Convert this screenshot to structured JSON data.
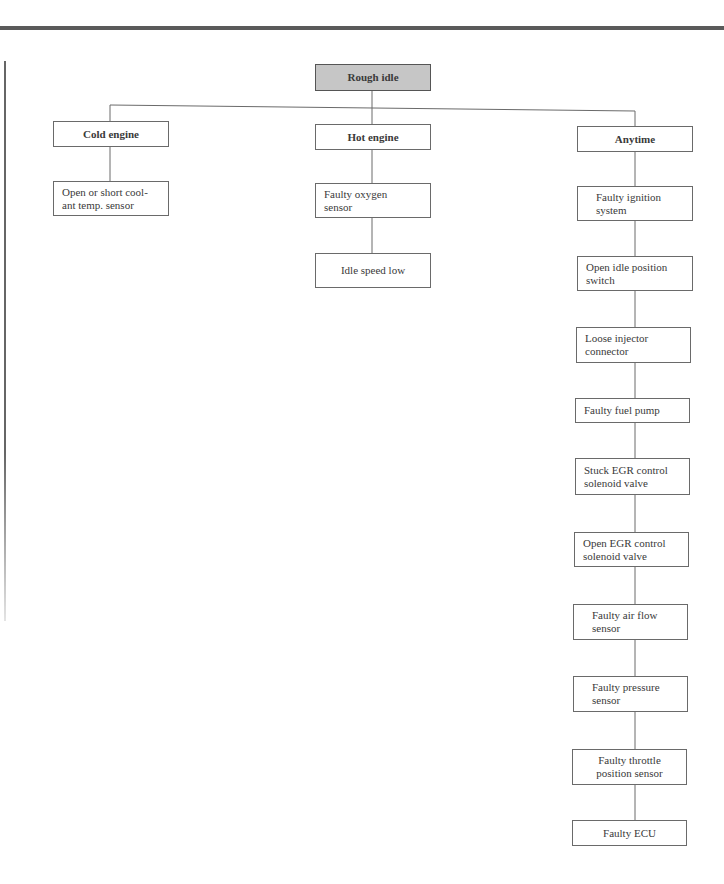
{
  "diagram": {
    "type": "fault-tree",
    "root": {
      "label": "Rough idle",
      "fill": "#c6c6c6"
    },
    "branches": [
      {
        "label": "Cold engine",
        "causes": [
          "Open or short cool-\nant temp. sensor"
        ]
      },
      {
        "label": "Hot engine",
        "causes": [
          "Faulty oxygen\nsensor",
          "Idle speed low"
        ]
      },
      {
        "label": "Anytime",
        "causes": [
          "Faulty ignition\nsystem",
          "Open idle position\nswitch",
          "Loose injector\nconnector",
          "Faulty fuel pump",
          "Stuck EGR control\nsolenoid valve",
          "Open EGR control\nsolenoid valve",
          "Faulty air flow\nsensor",
          "Faulty pressure\nsensor",
          "Faulty throttle\nposition sensor",
          "Faulty ECU"
        ]
      }
    ]
  },
  "colors": {
    "line": "#6a6a6a",
    "rule": "#5a5a5a",
    "text": "#3a3a3a",
    "root_fill": "#c6c6c6"
  }
}
